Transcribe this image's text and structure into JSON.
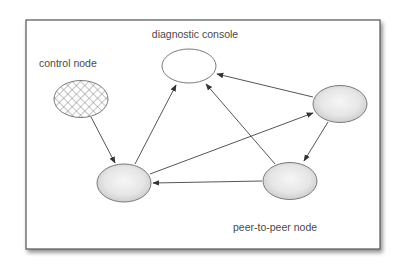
{
  "diagram": {
    "type": "network-topology",
    "labels": {
      "diagnostic_console": "diagnostic console",
      "control_node": "control node",
      "peer_to_peer_node": "peer-to-peer node"
    },
    "nodes": [
      {
        "id": "diagnostic-console",
        "label": "diagnostic console",
        "style": "hollow",
        "cx": 189,
        "cy": 66
      },
      {
        "id": "control-node",
        "label": "control node",
        "style": "cross-hatched",
        "cx": 81,
        "cy": 99
      },
      {
        "id": "peer-bottom-left",
        "label": "peer-to-peer node",
        "style": "shaded",
        "cx": 124,
        "cy": 183
      },
      {
        "id": "peer-right",
        "label": "peer-to-peer node",
        "style": "shaded",
        "cx": 340,
        "cy": 104
      },
      {
        "id": "peer-bottom-right",
        "label": "peer-to-peer node",
        "style": "shaded",
        "cx": 290,
        "cy": 181
      }
    ],
    "edges": [
      {
        "from": "control-node",
        "to": "peer-bottom-left"
      },
      {
        "from": "peer-bottom-left",
        "to": "diagnostic-console"
      },
      {
        "from": "peer-bottom-left",
        "to": "peer-right"
      },
      {
        "from": "peer-right",
        "to": "diagnostic-console"
      },
      {
        "from": "peer-right",
        "to": "peer-bottom-right"
      },
      {
        "from": "peer-bottom-right",
        "to": "diagnostic-console"
      },
      {
        "from": "peer-bottom-right",
        "to": "peer-bottom-left"
      }
    ],
    "colors": {
      "frame": "#555555",
      "edge": "#555555",
      "node_stroke": "#7a7a7a",
      "node_fill_center": "#f4f4f4",
      "node_fill_edge": "#cfcfcf",
      "hatch": "#8a8a8a",
      "text": "#4a4a4a"
    }
  }
}
